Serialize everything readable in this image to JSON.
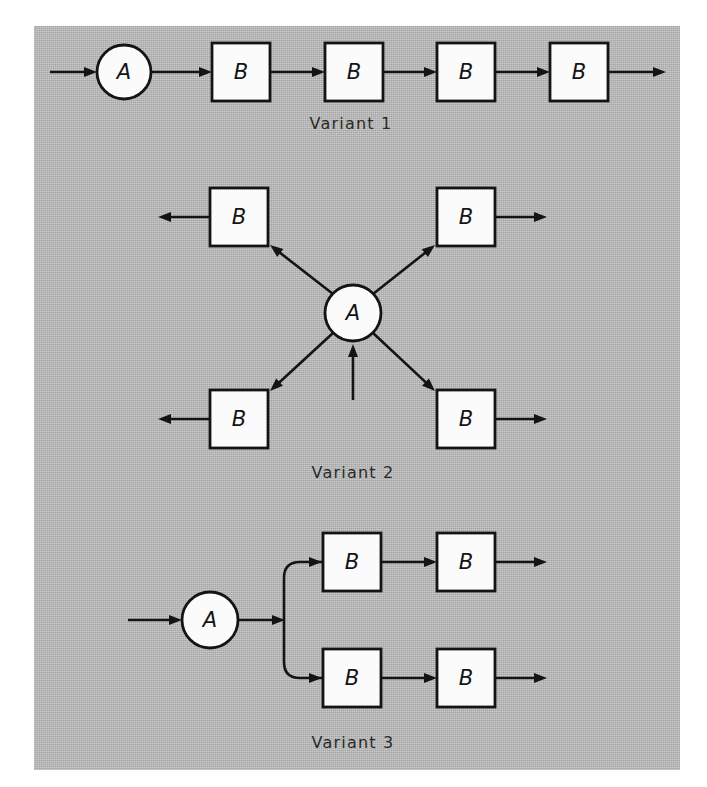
{
  "figure": {
    "background_color": "#b5b5b5",
    "ink_color": "#141414",
    "node_fill_color": "#fbfbfb",
    "node_labels": {
      "circle": "A",
      "box": "B"
    },
    "variants": [
      {
        "id": "variant-1",
        "caption": "Variant 1",
        "caption_x": 351,
        "caption_y": 129,
        "description": "Serial chain: one A circle followed by four B boxes in series",
        "circles": [
          {
            "name": "circle-a",
            "label": "A",
            "cx": 124,
            "cy": 72,
            "r": 27
          }
        ],
        "boxes": [
          {
            "name": "box-b-1",
            "label": "B",
            "x": 212,
            "y": 43,
            "w": 58,
            "h": 58
          },
          {
            "name": "box-b-2",
            "label": "B",
            "x": 325,
            "y": 43,
            "w": 58,
            "h": 58
          },
          {
            "name": "box-b-3",
            "label": "B",
            "x": 437,
            "y": 43,
            "w": 58,
            "h": 58
          },
          {
            "name": "box-b-4",
            "label": "B",
            "x": 550,
            "y": 43,
            "w": 58,
            "h": 58
          }
        ],
        "arrows": [
          {
            "name": "arrow-input",
            "x1": 50,
            "y1": 72,
            "x2": 97,
            "y2": 72
          },
          {
            "name": "arrow-a-to-b1",
            "x1": 151,
            "y1": 72,
            "x2": 212,
            "y2": 72
          },
          {
            "name": "arrow-b1-to-b2",
            "x1": 270,
            "y1": 72,
            "x2": 325,
            "y2": 72
          },
          {
            "name": "arrow-b2-to-b3",
            "x1": 383,
            "y1": 72,
            "x2": 437,
            "y2": 72
          },
          {
            "name": "arrow-b3-to-b4",
            "x1": 495,
            "y1": 72,
            "x2": 550,
            "y2": 72
          },
          {
            "name": "arrow-output",
            "x1": 608,
            "y1": 72,
            "x2": 666,
            "y2": 72
          }
        ]
      },
      {
        "id": "variant-2",
        "caption": "Variant 2",
        "caption_x": 353,
        "caption_y": 478,
        "description": "Star fan-out: a central A circle fed from below distributes to four B boxes arranged diagonally",
        "circles": [
          {
            "name": "circle-a",
            "label": "A",
            "cx": 353,
            "cy": 313,
            "r": 28
          }
        ],
        "boxes": [
          {
            "name": "box-b-upper-left",
            "label": "B",
            "x": 210,
            "y": 188,
            "w": 58,
            "h": 58
          },
          {
            "name": "box-b-upper-right",
            "label": "B",
            "x": 437,
            "y": 188,
            "w": 58,
            "h": 58
          },
          {
            "name": "box-b-lower-left",
            "label": "B",
            "x": 210,
            "y": 390,
            "w": 58,
            "h": 58
          },
          {
            "name": "box-b-lower-right",
            "label": "B",
            "x": 437,
            "y": 390,
            "w": 58,
            "h": 58
          }
        ],
        "arrows": [
          {
            "name": "arrow-input-bottom",
            "x1": 353,
            "y1": 400,
            "x2": 353,
            "y2": 344
          },
          {
            "name": "arrow-a-to-upper-left",
            "x1": 333,
            "y1": 294,
            "x2": 270,
            "y2": 245
          },
          {
            "name": "arrow-a-to-upper-right",
            "x1": 373,
            "y1": 294,
            "x2": 435,
            "y2": 245
          },
          {
            "name": "arrow-a-to-lower-left",
            "x1": 333,
            "y1": 333,
            "x2": 270,
            "y2": 391
          },
          {
            "name": "arrow-a-to-lower-right",
            "x1": 373,
            "y1": 333,
            "x2": 435,
            "y2": 391
          },
          {
            "name": "arrow-out-upper-left",
            "x1": 210,
            "y1": 217,
            "x2": 158,
            "y2": 217
          },
          {
            "name": "arrow-out-upper-right",
            "x1": 495,
            "y1": 217,
            "x2": 547,
            "y2": 217
          },
          {
            "name": "arrow-out-lower-left",
            "x1": 210,
            "y1": 419,
            "x2": 158,
            "y2": 419
          },
          {
            "name": "arrow-out-lower-right",
            "x1": 495,
            "y1": 419,
            "x2": 547,
            "y2": 419
          }
        ]
      },
      {
        "id": "variant-3",
        "caption": "Variant 3",
        "caption_x": 353,
        "caption_y": 748,
        "description": "Branching chain: one A circle splits into two parallel branches, each containing two B boxes in series",
        "circles": [
          {
            "name": "circle-a",
            "label": "A",
            "cx": 210,
            "cy": 620,
            "r": 28
          }
        ],
        "boxes": [
          {
            "name": "box-b-top-1",
            "label": "B",
            "x": 323,
            "y": 533,
            "w": 58,
            "h": 58
          },
          {
            "name": "box-b-top-2",
            "label": "B",
            "x": 437,
            "y": 533,
            "w": 58,
            "h": 58
          },
          {
            "name": "box-b-bottom-1",
            "label": "B",
            "x": 323,
            "y": 649,
            "w": 58,
            "h": 58
          },
          {
            "name": "box-b-bottom-2",
            "label": "B",
            "x": 437,
            "y": 649,
            "w": 58,
            "h": 58
          }
        ],
        "arrows": [
          {
            "name": "arrow-input",
            "x1": 128,
            "y1": 620,
            "x2": 182,
            "y2": 620
          },
          {
            "name": "arrow-a-to-split",
            "x1": 238,
            "y1": 620,
            "x2": 285,
            "y2": 620
          },
          {
            "name": "arrow-top-branch-to-b",
            "path": "M 284 620 L 284 578 Q 284 562 300 562 L 322 562",
            "head_x": 322,
            "head_y": 562
          },
          {
            "name": "arrow-bottom-branch-to-b",
            "path": "M 284 620 L 284 662 Q 284 678 300 678 L 322 678",
            "head_x": 322,
            "head_y": 678
          },
          {
            "name": "arrow-top-b1-to-b2",
            "x1": 381,
            "y1": 562,
            "x2": 437,
            "y2": 562
          },
          {
            "name": "arrow-top-output",
            "x1": 495,
            "y1": 562,
            "x2": 547,
            "y2": 562
          },
          {
            "name": "arrow-bottom-b1-to-b2",
            "x1": 381,
            "y1": 678,
            "x2": 437,
            "y2": 678
          },
          {
            "name": "arrow-bottom-output",
            "x1": 495,
            "y1": 678,
            "x2": 547,
            "y2": 678
          }
        ]
      }
    ]
  }
}
